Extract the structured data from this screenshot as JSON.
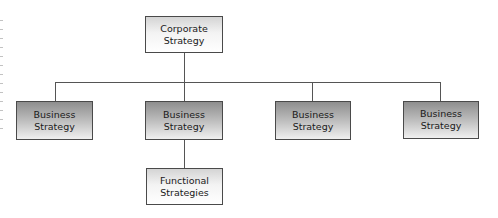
{
  "diagram": {
    "type": "hierarchy",
    "root": {
      "label_line1": "Corporate",
      "label_line2": "Strategy"
    },
    "level2": [
      {
        "label_line1": "Business",
        "label_line2": "Strategy"
      },
      {
        "label_line1": "Business",
        "label_line2": "Strategy"
      },
      {
        "label_line1": "Business",
        "label_line2": "Strategy"
      },
      {
        "label_line1": "Business",
        "label_line2": "Strategy"
      }
    ],
    "level3": {
      "parent_index": 1,
      "label_line1": "Functional",
      "label_line2": "Strategies"
    },
    "colors": {
      "line": "#555555",
      "border": "#4a4a4a",
      "dark_fill_top": "#8e8e8e",
      "light_fill_top": "#d4d4d4"
    }
  }
}
